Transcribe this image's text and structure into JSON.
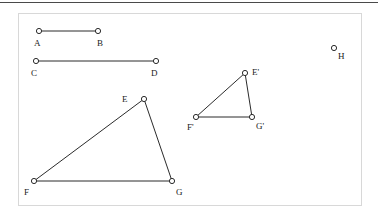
{
  "figure": {
    "frame": {
      "x": 18,
      "y": 13,
      "width": 344,
      "height": 193,
      "border_color": "#d8d8d8"
    },
    "top_rule_color": "#4a4a4a",
    "stroke_color": "#2b2b2b",
    "stroke_width": 1,
    "marker_radius": 2.6,
    "marker_fill": "#ffffff",
    "background": "#ffffff"
  },
  "points": [
    {
      "id": "A",
      "label": "A",
      "x": 39,
      "y": 31,
      "label_x": 34,
      "label_y": 39
    },
    {
      "id": "B",
      "label": "B",
      "x": 98,
      "y": 31,
      "label_x": 97,
      "label_y": 39
    },
    {
      "id": "C",
      "label": "C",
      "x": 36,
      "y": 61,
      "label_x": 31,
      "label_y": 69
    },
    {
      "id": "D",
      "label": "D",
      "x": 156,
      "y": 61,
      "label_x": 151,
      "label_y": 69
    },
    {
      "id": "E",
      "label": "E",
      "x": 144,
      "y": 99,
      "label_x": 122,
      "label_y": 95
    },
    {
      "id": "F",
      "label": "F",
      "x": 34,
      "y": 181,
      "label_x": 24,
      "label_y": 188
    },
    {
      "id": "G",
      "label": "G",
      "x": 172,
      "y": 181,
      "label_x": 176,
      "label_y": 188
    },
    {
      "id": "Ep",
      "label": "E'",
      "x": 245,
      "y": 73,
      "label_x": 252,
      "label_y": 68
    },
    {
      "id": "Fp",
      "label": "F'",
      "x": 196,
      "y": 117,
      "label_x": 187,
      "label_y": 123
    },
    {
      "id": "Gp",
      "label": "G'",
      "x": 252,
      "y": 117,
      "label_x": 256,
      "label_y": 122
    },
    {
      "id": "H",
      "label": "H",
      "x": 334,
      "y": 48,
      "label_x": 338,
      "label_y": 52
    }
  ],
  "segments": [
    {
      "name": "segment-AB",
      "from": "A",
      "to": "B"
    },
    {
      "name": "segment-CD",
      "from": "C",
      "to": "D"
    },
    {
      "name": "triangle-EFG-side-EF",
      "from": "E",
      "to": "F"
    },
    {
      "name": "triangle-EFG-side-FG",
      "from": "F",
      "to": "G"
    },
    {
      "name": "triangle-EFG-side-GE",
      "from": "G",
      "to": "E"
    },
    {
      "name": "triangle-EpFpGp-side-EpFp",
      "from": "Ep",
      "to": "Fp"
    },
    {
      "name": "triangle-EpFpGp-side-FpGp",
      "from": "Fp",
      "to": "Gp"
    },
    {
      "name": "triangle-EpFpGp-side-GpEp",
      "from": "Gp",
      "to": "Ep"
    }
  ]
}
